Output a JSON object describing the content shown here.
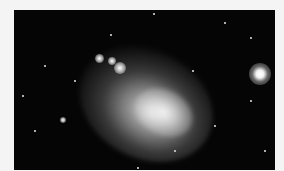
{
  "image": {
    "subject": "dwarf galaxy with nearby globular star cluster",
    "description": "Black-and-white astronomical photograph of an irregular galaxy (cloud of stars) with a bright compact star cluster at right",
    "colors": {
      "background": "#f4f4f4",
      "sky": "#050505",
      "galaxy": "#d8d8d8"
    }
  }
}
